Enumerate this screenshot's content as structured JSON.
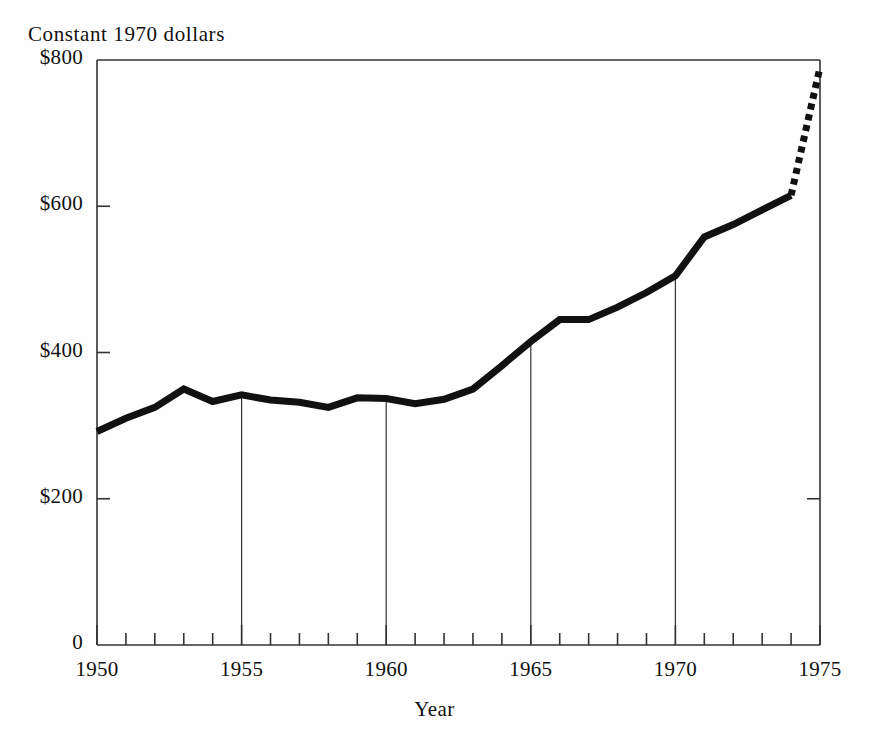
{
  "chart_data": {
    "type": "line",
    "title": "Constant 1970 dollars",
    "xlabel": "Year",
    "ylabel": "",
    "xlim": [
      1950,
      1975
    ],
    "ylim": [
      0,
      800
    ],
    "grid": false,
    "legend": "none",
    "x_tick_labels": [
      "1950",
      "1955",
      "1960",
      "1965",
      "1970",
      "1975"
    ],
    "x_tick_values": [
      1950,
      1955,
      1960,
      1965,
      1970,
      1975
    ],
    "x_minor_tick_interval": 1,
    "y_tick_labels": [
      "$800",
      "$600",
      "$400",
      "$200",
      "0"
    ],
    "y_tick_values": [
      800,
      600,
      400,
      200,
      0
    ],
    "reference_lines_x": [
      1955,
      1960,
      1965,
      1970
    ],
    "series": [
      {
        "name": "Actual",
        "style": "solid",
        "x": [
          1950,
          1951,
          1952,
          1953,
          1954,
          1955,
          1956,
          1957,
          1958,
          1959,
          1960,
          1961,
          1962,
          1963,
          1964,
          1965,
          1966,
          1967,
          1968,
          1969,
          1970,
          1971,
          1972,
          1973,
          1974
        ],
        "values": [
          292,
          310,
          325,
          350,
          333,
          342,
          335,
          332,
          325,
          338,
          337,
          330,
          336,
          350,
          382,
          415,
          445,
          445,
          462,
          482,
          505,
          558,
          575,
          595,
          615
        ]
      },
      {
        "name": "Projected",
        "style": "dotted",
        "x": [
          1974,
          1975
        ],
        "values": [
          615,
          790
        ]
      }
    ]
  },
  "style": {
    "ink_color": "#111111",
    "axis_color": "#333333",
    "background": "#fefefe",
    "line_width_px": 7,
    "dotted_width_px": 7
  }
}
